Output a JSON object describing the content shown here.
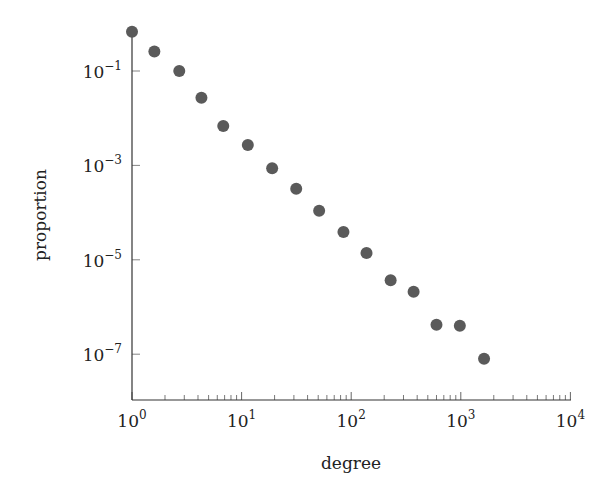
{
  "chart_data": {
    "type": "scatter",
    "title": "",
    "xlabel": "degree",
    "ylabel": "proportion",
    "xscale": "log",
    "yscale": "log",
    "xlim": [
      1,
      10000
    ],
    "ylim": [
      1e-08,
      1
    ],
    "grid": false,
    "legend": null,
    "x_ticks": [
      {
        "base": "10",
        "exp": "0",
        "value": 1
      },
      {
        "base": "10",
        "exp": "1",
        "value": 10
      },
      {
        "base": "10",
        "exp": "2",
        "value": 100
      },
      {
        "base": "10",
        "exp": "3",
        "value": 1000
      },
      {
        "base": "10",
        "exp": "4",
        "value": 10000
      }
    ],
    "y_ticks": [
      {
        "base": "10",
        "exp": "−1",
        "value": 0.1
      },
      {
        "base": "10",
        "exp": "−3",
        "value": 0.001
      },
      {
        "base": "10",
        "exp": "−5",
        "value": 1e-05
      },
      {
        "base": "10",
        "exp": "−7",
        "value": 1e-07
      }
    ],
    "marker_color": "#5a5a5a",
    "series": [
      {
        "name": "degree distribution",
        "x": [
          1,
          1.6,
          2.7,
          4.3,
          6.8,
          11.4,
          19,
          31.5,
          51,
          85,
          138,
          229,
          371,
          600,
          980,
          1630
        ],
        "y": [
          0.68,
          0.26,
          0.1,
          0.027,
          0.0068,
          0.0027,
          0.00087,
          0.00032,
          0.00011,
          3.9e-05,
          1.4e-05,
          3.7e-06,
          2.1e-06,
          4.2e-07,
          4e-07,
          8e-08
        ]
      }
    ]
  }
}
